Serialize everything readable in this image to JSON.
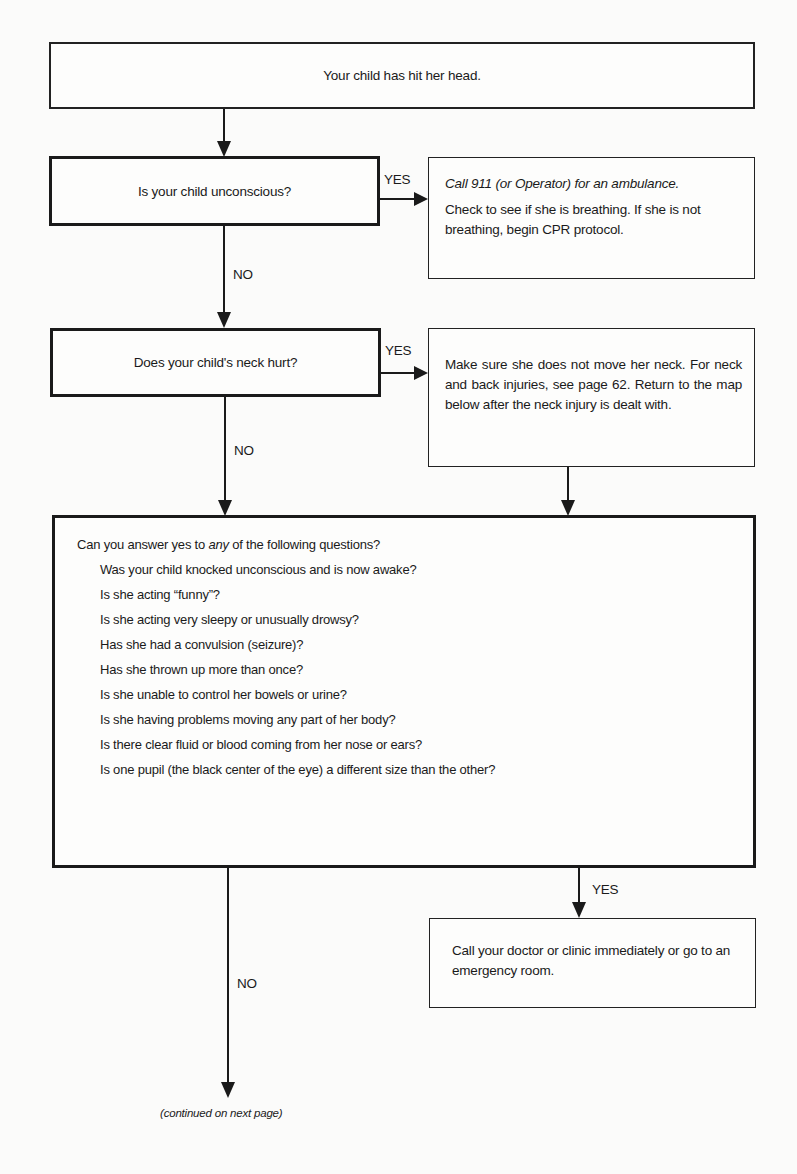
{
  "start": {
    "text": "Your child has hit her head."
  },
  "question1": {
    "text": "Is your child unconscious?",
    "yes_label": "YES",
    "no_label": "NO",
    "yes_action": {
      "line1_italic": "Call 911 (or Operator) for an ambulance.",
      "line2": "Check to see if she is breathing. If she is not breathing, begin CPR protocol."
    }
  },
  "question2": {
    "text": "Does your child's neck hurt?",
    "yes_label": "YES",
    "no_label": "NO",
    "yes_action": {
      "text": "Make sure she does not move her neck. For neck and back injuries, see page 62. Return to the map below after the neck injury is dealt with."
    }
  },
  "question3": {
    "intro_prefix": "Can you answer yes to ",
    "intro_emphasis": "any",
    "intro_suffix": " of the following questions?",
    "items": [
      "Was your child knocked unconscious and is now awake?",
      "Is she acting “funny”?",
      "Is she acting very sleepy or unusually drowsy?",
      "Has she had a convulsion (seizure)?",
      "Has she thrown up more than once?",
      "Is she unable to control her bowels or urine?",
      "Is she having problems moving any part of her body?",
      "Is there clear fluid or blood coming from her nose or ears?",
      "Is one pupil (the black center of the eye) a different size than the other?"
    ],
    "yes_label": "YES",
    "no_label": "NO",
    "yes_action": {
      "text": "Call your doctor or clinic immediately or go to an emergency room."
    }
  },
  "footer": {
    "continued": "(continued on next page)"
  }
}
